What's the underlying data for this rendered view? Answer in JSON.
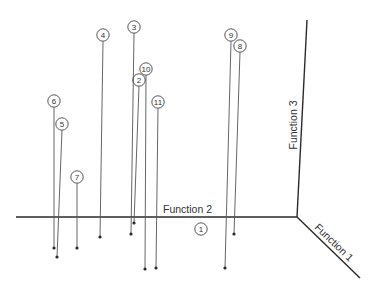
{
  "chart_data": {
    "type": "scatter",
    "subtype": "3d-stem-scatter",
    "title": "",
    "axes": {
      "x": {
        "label": "Function 2"
      },
      "y": {
        "label": "Function 3"
      },
      "z": {
        "label": "Function 1"
      }
    },
    "grid": false,
    "legend": null,
    "points": [
      {
        "id": "1",
        "label": "1",
        "marker": [
          201,
          229
        ],
        "base": null
      },
      {
        "id": "2",
        "label": "2",
        "marker": [
          139,
          80
        ],
        "base": [
          134,
          223
        ]
      },
      {
        "id": "3",
        "label": "3",
        "marker": [
          134,
          27
        ],
        "base": [
          131,
          234
        ]
      },
      {
        "id": "4",
        "label": "4",
        "marker": [
          103,
          35
        ],
        "base": [
          100,
          237
        ]
      },
      {
        "id": "5",
        "label": "5",
        "marker": [
          62,
          124
        ],
        "base": [
          57,
          257
        ]
      },
      {
        "id": "6",
        "label": "6",
        "marker": [
          54,
          101
        ],
        "base": [
          54,
          248
        ]
      },
      {
        "id": "7",
        "label": "7",
        "marker": [
          77,
          177
        ],
        "base": [
          77,
          248
        ]
      },
      {
        "id": "8",
        "label": "8",
        "marker": [
          240,
          46
        ],
        "base": [
          234,
          234
        ]
      },
      {
        "id": "9",
        "label": "9",
        "marker": [
          231,
          35
        ],
        "base": [
          225,
          268
        ]
      },
      {
        "id": "10",
        "label": "10",
        "marker": [
          146,
          69
        ],
        "base": [
          145,
          269
        ]
      },
      {
        "id": "11",
        "label": "11",
        "marker": [
          158,
          102
        ],
        "base": [
          156,
          268
        ]
      }
    ],
    "axis_geometry": {
      "origin": [
        297,
        217
      ],
      "function2_start": [
        16,
        217
      ],
      "function3_end": [
        307,
        20
      ],
      "function1_end": [
        360,
        278
      ]
    }
  },
  "labels": {
    "function2": "Function 2",
    "function3": "Function 3",
    "function1": "Function 1"
  }
}
